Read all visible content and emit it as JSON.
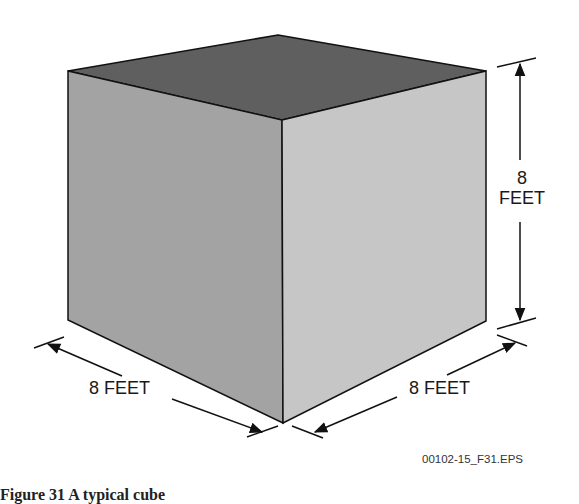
{
  "figure": {
    "subject": "cube",
    "dimensions": {
      "height": {
        "value": "8",
        "unit": "FEET"
      },
      "left_width": {
        "label": "8 FEET"
      },
      "right_depth": {
        "label": "8 FEET"
      }
    },
    "file_code": "00102-15_F31.EPS",
    "caption_partial": "Figure 31 A typical cube"
  },
  "colors": {
    "top_face": "#5f5f5f",
    "left_face": "#a3a3a3",
    "right_face": "#c6c6c6",
    "edges": "#111111"
  }
}
